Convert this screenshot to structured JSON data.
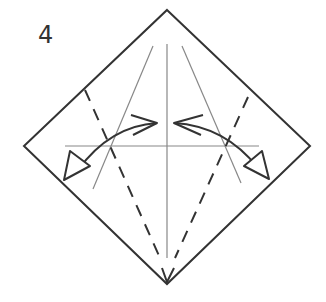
{
  "diagram": {
    "step_number": "4",
    "colors": {
      "outline": "#333333",
      "crease": "#888888",
      "arrow": "#333333",
      "background": "#ffffff"
    },
    "elements": {
      "paper": "square paper oriented as diamond",
      "creases": [
        "vertical center crease",
        "horizontal center crease",
        "left diagonal crease",
        "right diagonal crease"
      ],
      "valley_folds": [
        "left dashed valley fold line",
        "right dashed valley fold line"
      ],
      "arrows": [
        "left fold arrow (fold edge to center and unfold)",
        "right fold arrow (fold edge to center and unfold)"
      ]
    }
  }
}
